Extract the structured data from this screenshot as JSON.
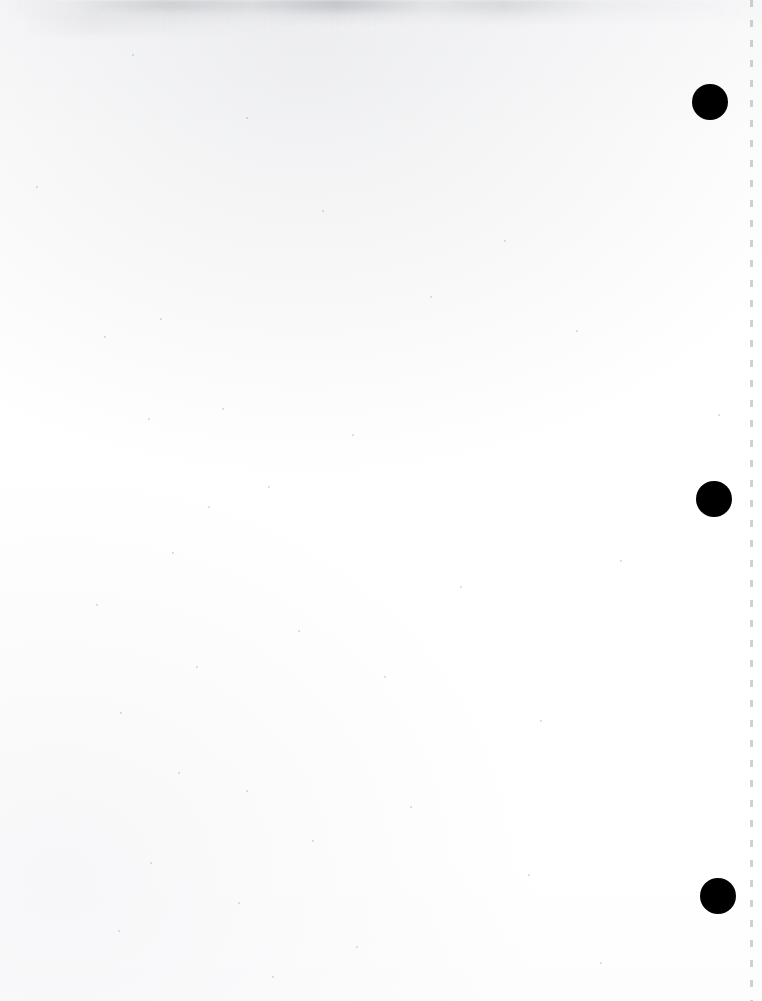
{
  "document": {
    "title": "Scanned Blank Page",
    "page_kind": "blank-separator-page",
    "width": 762,
    "height": 1001,
    "background_color": "#ffffff",
    "mark_color": "#000000",
    "perforation_color": "#a8aab0",
    "smudge_color": "#b8babe"
  },
  "registration_marks": [
    {
      "name": "registration-mark-top",
      "cx": 710,
      "cy": 102,
      "diameter": 36
    },
    {
      "name": "registration-mark-middle",
      "cx": 714,
      "cy": 499,
      "diameter": 36
    },
    {
      "name": "registration-mark-bottom",
      "cx": 718,
      "cy": 896,
      "diameter": 36
    }
  ],
  "perforation_line": {
    "name": "perforation-line",
    "x": 750,
    "top": 0,
    "height": 1001,
    "dash_length": 7,
    "gap_length": 13
  },
  "top_smudge": {
    "name": "top-edge-smudge",
    "x": 0,
    "y": 0,
    "width": 762,
    "height": 26
  },
  "speckles": [
    {
      "x": 132,
      "y": 54,
      "size": 2
    },
    {
      "x": 246,
      "y": 117,
      "size": 2
    },
    {
      "x": 36,
      "y": 186,
      "size": 2
    },
    {
      "x": 322,
      "y": 210,
      "size": 2
    },
    {
      "x": 504,
      "y": 240,
      "size": 2
    },
    {
      "x": 430,
      "y": 296,
      "size": 2
    },
    {
      "x": 160,
      "y": 318,
      "size": 2
    },
    {
      "x": 576,
      "y": 330,
      "size": 2
    },
    {
      "x": 104,
      "y": 336,
      "size": 2
    },
    {
      "x": 718,
      "y": 414,
      "size": 2
    },
    {
      "x": 222,
      "y": 408,
      "size": 2
    },
    {
      "x": 352,
      "y": 434,
      "size": 2
    },
    {
      "x": 148,
      "y": 418,
      "size": 2
    },
    {
      "x": 268,
      "y": 486,
      "size": 2
    },
    {
      "x": 208,
      "y": 506,
      "size": 2
    },
    {
      "x": 172,
      "y": 552,
      "size": 2
    },
    {
      "x": 620,
      "y": 560,
      "size": 2
    },
    {
      "x": 460,
      "y": 586,
      "size": 2
    },
    {
      "x": 96,
      "y": 604,
      "size": 2
    },
    {
      "x": 298,
      "y": 630,
      "size": 2
    },
    {
      "x": 196,
      "y": 666,
      "size": 2
    },
    {
      "x": 384,
      "y": 676,
      "size": 2
    },
    {
      "x": 120,
      "y": 712,
      "size": 2
    },
    {
      "x": 540,
      "y": 720,
      "size": 2
    },
    {
      "x": 178,
      "y": 772,
      "size": 2
    },
    {
      "x": 246,
      "y": 790,
      "size": 2
    },
    {
      "x": 410,
      "y": 806,
      "size": 2
    },
    {
      "x": 312,
      "y": 840,
      "size": 2
    },
    {
      "x": 150,
      "y": 862,
      "size": 2
    },
    {
      "x": 528,
      "y": 874,
      "size": 2
    },
    {
      "x": 238,
      "y": 902,
      "size": 2
    },
    {
      "x": 118,
      "y": 930,
      "size": 2
    },
    {
      "x": 356,
      "y": 946,
      "size": 2
    },
    {
      "x": 600,
      "y": 962,
      "size": 2
    },
    {
      "x": 272,
      "y": 976,
      "size": 2
    }
  ]
}
